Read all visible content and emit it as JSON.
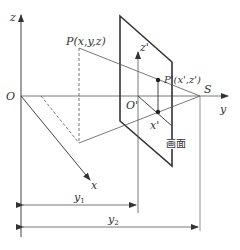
{
  "diagram": {
    "type": "perspective-projection",
    "colors": {
      "line": "#444444",
      "plane": "#333333",
      "dim": "#555555",
      "background": "#ffffff"
    },
    "labels": {
      "z_axis": "z",
      "origin": "O",
      "x_axis": "x",
      "y_axis": "y",
      "point_P": "P(x,y,z)",
      "origin_prime": "O'",
      "z_prime_axis": "z'",
      "x_prime": "x'",
      "point_P_prime": "P'(x',z')",
      "station_point": "S",
      "picture_plane": "画面",
      "dim_y1": "y",
      "dim_y1_sub": "1",
      "dim_y2": "y",
      "dim_y2_sub": "2"
    }
  }
}
